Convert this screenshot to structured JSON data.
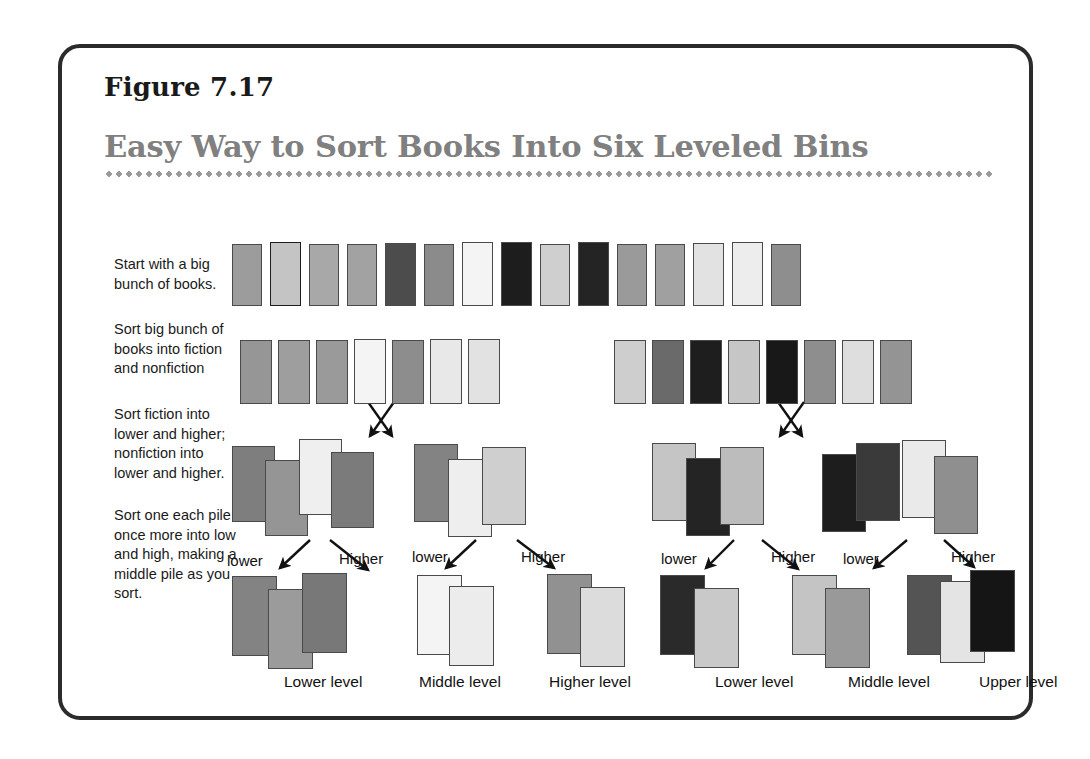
{
  "figure": {
    "number": "Figure 7.17",
    "title": "Easy Way to Sort Books Into Six Leveled Bins"
  },
  "steps": [
    {
      "id": "step-1",
      "text": "Start with a big bunch of books."
    },
    {
      "id": "step-2",
      "text": "Sort big bunch of books into fiction and nonfiction"
    },
    {
      "id": "step-3",
      "text": "Sort fiction into lower and higher; nonfiction into lower and higher."
    },
    {
      "id": "step-4",
      "text": "Sort one each pile once more into low and high, making a middle pile as you sort."
    }
  ],
  "flow_labels": [
    {
      "text": "lower",
      "x": 165,
      "y": 504
    },
    {
      "text": "Higher",
      "x": 277,
      "y": 502
    },
    {
      "text": "lower",
      "x": 350,
      "y": 500
    },
    {
      "text": "Higher",
      "x": 459,
      "y": 500
    },
    {
      "text": "lower",
      "x": 599,
      "y": 502
    },
    {
      "text": "Higher",
      "x": 709,
      "y": 500
    },
    {
      "text": "lower",
      "x": 781,
      "y": 502
    },
    {
      "text": "Higher",
      "x": 889,
      "y": 500
    }
  ],
  "level_labels": [
    {
      "text": "Lower level",
      "x": 222,
      "y": 625
    },
    {
      "text": "Middle level",
      "x": 357,
      "y": 625
    },
    {
      "text": "Higher level",
      "x": 487,
      "y": 625
    },
    {
      "text": "Lower level",
      "x": 653,
      "y": 625
    },
    {
      "text": "Middle level",
      "x": 786,
      "y": 625
    },
    {
      "text": "Upper level",
      "x": 917,
      "y": 625
    }
  ],
  "palette": {
    "white": "#fbfbfb",
    "near_white": "#f2f2f2",
    "very_light": "#e4e4e4",
    "light": "#d2d2d2",
    "light_mid": "#c0c0c0",
    "mid": "#a9a9a9",
    "mid_dark": "#8f8f8f",
    "dark": "#6e6e6e",
    "darker": "#4f4f4f",
    "near_black": "#2b2b2b",
    "black": "#161616",
    "title_gray": "#808080",
    "ink": "#1a1a1a",
    "border": "#2b2b2b"
  },
  "rows": {
    "row1_label": "big-bunch-of-books",
    "row1_books": [
      {
        "x": 170,
        "y": 196,
        "w": 30,
        "h": 62,
        "fill": "#9c9c9c"
      },
      {
        "x": 208,
        "y": 194,
        "w": 31,
        "h": 64,
        "fill": "#c4c4c4",
        "outline": "dark"
      },
      {
        "x": 247,
        "y": 196,
        "w": 30,
        "h": 62,
        "fill": "#a8a8a8"
      },
      {
        "x": 285,
        "y": 196,
        "w": 30,
        "h": 62,
        "fill": "#a2a2a2"
      },
      {
        "x": 323,
        "y": 195,
        "w": 31,
        "h": 63,
        "fill": "#4c4c4c"
      },
      {
        "x": 362,
        "y": 196,
        "w": 30,
        "h": 62,
        "fill": "#8b8b8b"
      },
      {
        "x": 400,
        "y": 194,
        "w": 31,
        "h": 64,
        "fill": "#f4f4f4"
      },
      {
        "x": 439,
        "y": 194,
        "w": 31,
        "h": 64,
        "fill": "#1d1d1d"
      },
      {
        "x": 478,
        "y": 196,
        "w": 30,
        "h": 62,
        "fill": "#cfcfcf"
      },
      {
        "x": 516,
        "y": 194,
        "w": 31,
        "h": 64,
        "fill": "#242424"
      },
      {
        "x": 555,
        "y": 196,
        "w": 30,
        "h": 62,
        "fill": "#9a9a9a"
      },
      {
        "x": 593,
        "y": 196,
        "w": 30,
        "h": 62,
        "fill": "#a0a0a0"
      },
      {
        "x": 631,
        "y": 195,
        "w": 31,
        "h": 63,
        "fill": "#e2e2e2"
      },
      {
        "x": 670,
        "y": 194,
        "w": 31,
        "h": 64,
        "fill": "#ededed"
      },
      {
        "x": 709,
        "y": 196,
        "w": 30,
        "h": 62,
        "fill": "#8e8e8e"
      }
    ],
    "row2_fiction_label": "fiction-group",
    "row2_fiction_books": [
      {
        "x": 178,
        "y": 292,
        "w": 32,
        "h": 64,
        "fill": "#969696"
      },
      {
        "x": 216,
        "y": 292,
        "w": 32,
        "h": 64,
        "fill": "#9e9e9e"
      },
      {
        "x": 254,
        "y": 292,
        "w": 32,
        "h": 64,
        "fill": "#9a9a9a"
      },
      {
        "x": 292,
        "y": 291,
        "w": 32,
        "h": 65,
        "fill": "#f4f4f4"
      },
      {
        "x": 330,
        "y": 292,
        "w": 32,
        "h": 64,
        "fill": "#8d8d8d"
      },
      {
        "x": 368,
        "y": 291,
        "w": 32,
        "h": 65,
        "fill": "#e8e8e8"
      },
      {
        "x": 406,
        "y": 291,
        "w": 32,
        "h": 65,
        "fill": "#e2e2e2"
      }
    ],
    "row2_nonfiction_label": "nonfiction-group",
    "row2_nonfiction_books": [
      {
        "x": 552,
        "y": 292,
        "w": 32,
        "h": 64,
        "fill": "#cecece"
      },
      {
        "x": 590,
        "y": 292,
        "w": 32,
        "h": 64,
        "fill": "#6a6a6a"
      },
      {
        "x": 628,
        "y": 292,
        "w": 32,
        "h": 64,
        "fill": "#1e1e1e"
      },
      {
        "x": 666,
        "y": 292,
        "w": 32,
        "h": 64,
        "fill": "#c6c6c6"
      },
      {
        "x": 704,
        "y": 292,
        "w": 32,
        "h": 64,
        "fill": "#181818"
      },
      {
        "x": 742,
        "y": 292,
        "w": 32,
        "h": 64,
        "fill": "#8e8e8e"
      },
      {
        "x": 780,
        "y": 292,
        "w": 32,
        "h": 64,
        "fill": "#dedede"
      },
      {
        "x": 818,
        "y": 292,
        "w": 32,
        "h": 64,
        "fill": "#949494"
      }
    ],
    "row3_pile_a_label": "fiction-lower-pile",
    "row3_pile_a_books": [
      {
        "x": 170,
        "y": 398,
        "w": 43,
        "h": 76,
        "fill": "#7e7e7e"
      },
      {
        "x": 203,
        "y": 412,
        "w": 43,
        "h": 76,
        "fill": "#959595"
      },
      {
        "x": 237,
        "y": 391,
        "w": 43,
        "h": 76,
        "fill": "#efefef"
      },
      {
        "x": 269,
        "y": 404,
        "w": 43,
        "h": 76,
        "fill": "#7b7b7b"
      }
    ],
    "row3_pile_b_label": "fiction-higher-pile",
    "row3_pile_b_books": [
      {
        "x": 352,
        "y": 396,
        "w": 44,
        "h": 78,
        "fill": "#838383"
      },
      {
        "x": 386,
        "y": 411,
        "w": 44,
        "h": 78,
        "fill": "#eeeeee"
      },
      {
        "x": 420,
        "y": 399,
        "w": 44,
        "h": 78,
        "fill": "#cfcfcf"
      }
    ],
    "row3_pile_c_label": "nonfiction-lower-pile",
    "row3_pile_c_books": [
      {
        "x": 590,
        "y": 395,
        "w": 44,
        "h": 78,
        "fill": "#c5c5c5"
      },
      {
        "x": 624,
        "y": 410,
        "w": 44,
        "h": 78,
        "fill": "#242424"
      },
      {
        "x": 658,
        "y": 399,
        "w": 44,
        "h": 78,
        "fill": "#bcbcbc"
      }
    ],
    "row3_pile_d_label": "nonfiction-higher-pile",
    "row3_pile_d_books": [
      {
        "x": 760,
        "y": 406,
        "w": 44,
        "h": 78,
        "fill": "#1d1d1d"
      },
      {
        "x": 794,
        "y": 395,
        "w": 44,
        "h": 78,
        "fill": "#3a3a3a"
      },
      {
        "x": 840,
        "y": 392,
        "w": 44,
        "h": 78,
        "fill": "#eaeaea"
      },
      {
        "x": 872,
        "y": 408,
        "w": 44,
        "h": 78,
        "fill": "#8f8f8f"
      }
    ],
    "row4_bin1_label": "bin-fiction-lower-level",
    "row4_bin1_books": [
      {
        "x": 170,
        "y": 528,
        "w": 45,
        "h": 80,
        "fill": "#838383"
      },
      {
        "x": 206,
        "y": 541,
        "w": 45,
        "h": 80,
        "fill": "#9b9b9b"
      },
      {
        "x": 240,
        "y": 525,
        "w": 45,
        "h": 80,
        "fill": "#787878"
      }
    ],
    "row4_bin2_label": "bin-fiction-middle-level",
    "row4_bin2_books": [
      {
        "x": 355,
        "y": 527,
        "w": 45,
        "h": 80,
        "fill": "#f4f4f4"
      },
      {
        "x": 387,
        "y": 538,
        "w": 45,
        "h": 80,
        "fill": "#ececec"
      }
    ],
    "row4_bin3_label": "bin-fiction-higher-level",
    "row4_bin3_books": [
      {
        "x": 485,
        "y": 526,
        "w": 45,
        "h": 80,
        "fill": "#919191"
      },
      {
        "x": 518,
        "y": 539,
        "w": 45,
        "h": 80,
        "fill": "#dcdcdc"
      }
    ],
    "row4_bin4_label": "bin-nonfiction-lower-level",
    "row4_bin4_books": [
      {
        "x": 598,
        "y": 527,
        "w": 45,
        "h": 80,
        "fill": "#2a2a2a"
      },
      {
        "x": 632,
        "y": 540,
        "w": 45,
        "h": 80,
        "fill": "#c9c9c9"
      }
    ],
    "row4_bin5_label": "bin-nonfiction-middle-level",
    "row4_bin5_books": [
      {
        "x": 730,
        "y": 527,
        "w": 45,
        "h": 80,
        "fill": "#c4c4c4"
      },
      {
        "x": 763,
        "y": 540,
        "w": 45,
        "h": 80,
        "fill": "#999999"
      }
    ],
    "row4_bin6_label": "bin-nonfiction-upper-level",
    "row4_bin6_books": [
      {
        "x": 845,
        "y": 527,
        "w": 45,
        "h": 80,
        "fill": "#545454"
      },
      {
        "x": 878,
        "y": 533,
        "w": 45,
        "h": 82,
        "fill": "#e4e4e4"
      },
      {
        "x": 908,
        "y": 522,
        "w": 45,
        "h": 82,
        "fill": "#151515"
      }
    ]
  },
  "arrows": {
    "cross_left": {
      "label": "fiction-split-cross"
    },
    "cross_right": {
      "label": "nonfiction-split-cross"
    }
  }
}
